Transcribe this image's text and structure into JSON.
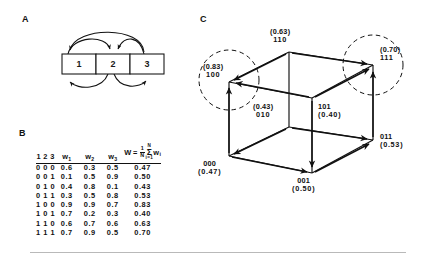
{
  "figure": {
    "panels": {
      "a_letter": "A",
      "b_letter": "B",
      "c_letter": "C"
    }
  },
  "panel_a": {
    "units": [
      {
        "label": "1"
      },
      {
        "label": "2"
      },
      {
        "label": "3"
      }
    ]
  },
  "panel_b": {
    "headers": {
      "state": "1 2 3",
      "w1": "w",
      "w1_sub": "1",
      "w2": "w",
      "w2_sub": "2",
      "w3": "w",
      "w3_sub": "3",
      "W": "W",
      "W_eq": "=",
      "W_num": "1",
      "W_den": "N",
      "W_sum_upper": "N",
      "W_sum_sigma": "Σ",
      "W_sum_lower": "i=1",
      "W_term": "w",
      "W_term_sub": "i"
    },
    "rows": [
      {
        "state": "0 0 0",
        "w1": "0.6",
        "w2": "0.3",
        "w3": "0.5",
        "W": "0.47"
      },
      {
        "state": "0 0 1",
        "w1": "0.1",
        "w2": "0.5",
        "w3": "0.9",
        "W": "0.50"
      },
      {
        "state": "0 1 0",
        "w1": "0.4",
        "w2": "0.8",
        "w3": "0.1",
        "W": "0.43"
      },
      {
        "state": "0 1 1",
        "w1": "0.3",
        "w2": "0.5",
        "w3": "0.8",
        "W": "0.53"
      },
      {
        "state": "1 0 0",
        "w1": "0.9",
        "w2": "0.9",
        "w3": "0.7",
        "W": "0.83"
      },
      {
        "state": "1 0 1",
        "w1": "0.7",
        "w2": "0.2",
        "w3": "0.3",
        "W": "0.40"
      },
      {
        "state": "1 1 0",
        "w1": "0.6",
        "w2": "0.7",
        "w3": "0.6",
        "W": "0.63"
      },
      {
        "state": "1 1 1",
        "w1": "0.7",
        "w2": "0.9",
        "w3": "0.5",
        "W": "0.70"
      }
    ]
  },
  "chart_data": {
    "type": "diagram",
    "vertices": [
      {
        "state": "000",
        "W": "(0.47)",
        "value": 0.47,
        "attractor": false
      },
      {
        "state": "001",
        "W": "(0.50)",
        "value": 0.5,
        "attractor": false
      },
      {
        "state": "010",
        "W": "(0.43)",
        "value": 0.43,
        "attractor": false
      },
      {
        "state": "011",
        "W": "(0.53)",
        "value": 0.53,
        "attractor": false
      },
      {
        "state": "100",
        "W": "(0.83)",
        "value": 0.83,
        "attractor": true
      },
      {
        "state": "101",
        "W": "(0.40)",
        "value": 0.4,
        "attractor": false
      },
      {
        "state": "110",
        "W": "(0.63)",
        "value": 0.63,
        "attractor": false
      },
      {
        "state": "111",
        "W": "(0.70)",
        "value": 0.7,
        "attractor": true
      }
    ],
    "attractors": [
      "100",
      "111"
    ],
    "transitions": [
      {
        "from": "110",
        "to": "100"
      },
      {
        "from": "101",
        "to": "100"
      },
      {
        "from": "000",
        "to": "100"
      },
      {
        "from": "110",
        "to": "111"
      },
      {
        "from": "011",
        "to": "111"
      },
      {
        "from": "101",
        "to": "111"
      },
      {
        "from": "010",
        "to": "000"
      },
      {
        "from": "010",
        "to": "011"
      },
      {
        "from": "000",
        "to": "001"
      },
      {
        "from": "001",
        "to": "011"
      },
      {
        "from": "101",
        "to": "001"
      }
    ]
  },
  "panel_c_labels": {
    "v110": {
      "W": "(0.63)",
      "state": "110"
    },
    "v111": {
      "W": "(0.70)",
      "state": "111"
    },
    "v100": {
      "W": "(0.83)",
      "state": "100"
    },
    "v101": {
      "state": "101",
      "W": "(0.40)"
    },
    "v010": {
      "W": "(0.43)",
      "state": "010"
    },
    "v011": {
      "state": "011",
      "W": "(0.53)"
    },
    "v000": {
      "state": "000",
      "W": "(0.47)"
    },
    "v001": {
      "state": "001",
      "W": "(0.50)"
    }
  }
}
